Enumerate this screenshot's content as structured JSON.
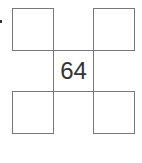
{
  "diagram": {
    "type": "cross-square-grid",
    "cells": {
      "top_left": "",
      "top_right": "",
      "center": "64",
      "bottom_left": "",
      "bottom_right": ""
    },
    "colors": {
      "border": "#777777",
      "text": "#333333",
      "background": "#ffffff"
    }
  }
}
